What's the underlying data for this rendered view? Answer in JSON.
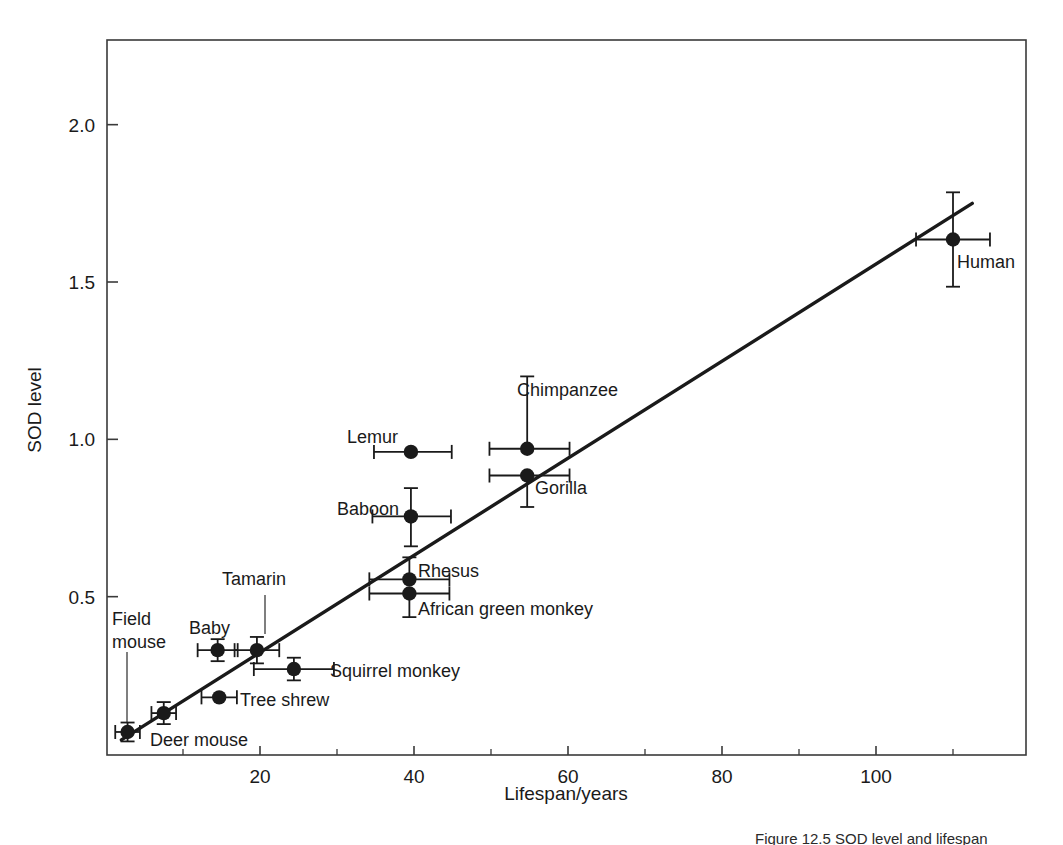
{
  "figure": {
    "caption": "Figure 12.5 SOD level and lifespan",
    "background": "#ffffff",
    "ink_color": "#1a1a1a"
  },
  "chart_data": {
    "type": "scatter",
    "title": "",
    "xlabel": "Lifespan/years",
    "ylabel": "SOD level",
    "xlim": [
      0,
      119.7
    ],
    "ylim": [
      0,
      2.27
    ],
    "xticks": [
      20,
      40,
      60,
      80,
      100
    ],
    "xtick_labels": [
      "20",
      "40",
      "60",
      "80",
      "100"
    ],
    "xminor_ticks": [
      10,
      30,
      50,
      70,
      90,
      110
    ],
    "yticks": [
      0.5,
      1.0,
      1.5,
      2.0
    ],
    "ytick_labels": [
      "0.5",
      "1.0",
      "1.5",
      "2.0"
    ],
    "grid": false,
    "legend": "none",
    "points": [
      {
        "name": "Deer mouse",
        "x": 2.8,
        "y": 0.07,
        "xerr_low": 1.6,
        "xerr_high": 1.6,
        "yerr_low": 0.03,
        "yerr_high": 0.03,
        "label": "Deer mouse",
        "label_x": 150,
        "label_y": 746,
        "anchor": "start",
        "leader": null
      },
      {
        "name": "Field mouse",
        "x": 7.5,
        "y": 0.13,
        "xerr_low": 1.6,
        "xerr_high": 1.6,
        "yerr_low": 0.035,
        "yerr_high": 0.035,
        "label": "Field\nmouse",
        "label_x": 112,
        "label_y": 625,
        "anchor": "start",
        "leader": {
          "x1": 127,
          "y1": 652,
          "x2": 127,
          "y2": 722
        }
      },
      {
        "name": "Tree shrew",
        "x": 14.7,
        "y": 0.18,
        "xerr_low": 2.3,
        "xerr_high": 2.3,
        "yerr_low": 0.0,
        "yerr_high": 0.0,
        "label": "Tree shrew",
        "label_x": 240,
        "label_y": 706,
        "anchor": "start",
        "leader": null
      },
      {
        "name": "Baby",
        "x": 14.5,
        "y": 0.33,
        "xerr_low": 2.6,
        "xerr_high": 2.6,
        "yerr_low": 0.035,
        "yerr_high": 0.035,
        "label": "Baby",
        "label_x": 189,
        "label_y": 634,
        "anchor": "start",
        "leader": null
      },
      {
        "name": "Tamarin",
        "x": 19.6,
        "y": 0.33,
        "xerr_low": 2.9,
        "xerr_high": 2.9,
        "yerr_low": 0.042,
        "yerr_high": 0.042,
        "label": "Tamarin",
        "label_x": 222,
        "label_y": 585,
        "anchor": "start",
        "leader": {
          "x1": 265,
          "y1": 595,
          "x2": 265,
          "y2": 634
        }
      },
      {
        "name": "Squirrel monkey",
        "x": 24.4,
        "y": 0.27,
        "xerr_low": 5.2,
        "xerr_high": 5.2,
        "yerr_low": 0.036,
        "yerr_high": 0.036,
        "label": "Squirrel monkey",
        "label_x": 330,
        "label_y": 677,
        "anchor": "start",
        "leader": null
      },
      {
        "name": "African green monkey",
        "x": 39.4,
        "y": 0.51,
        "xerr_low": 5.2,
        "xerr_high": 5.2,
        "yerr_low": 0.075,
        "yerr_high": 0.0,
        "label": "African green monkey",
        "label_x": 418,
        "label_y": 615,
        "anchor": "start",
        "leader": null
      },
      {
        "name": "Rhesus",
        "x": 39.4,
        "y": 0.555,
        "xerr_low": 5.2,
        "xerr_high": 5.2,
        "yerr_low": 0.0,
        "yerr_high": 0.07,
        "label": "Rhesus",
        "label_x": 418,
        "label_y": 577,
        "anchor": "start",
        "leader": null
      },
      {
        "name": "Baboon",
        "x": 39.6,
        "y": 0.755,
        "xerr_low": 5.0,
        "xerr_high": 5.2,
        "yerr_low": 0.095,
        "yerr_high": 0.09,
        "label": "Baboon",
        "label_x": 337,
        "label_y": 515,
        "anchor": "start",
        "leader": null
      },
      {
        "name": "Lemur",
        "x": 39.6,
        "y": 0.96,
        "xerr_low": 4.8,
        "xerr_high": 5.3,
        "yerr_low": 0.0,
        "yerr_high": 0.0,
        "label": "Lemur",
        "label_x": 347,
        "label_y": 443,
        "anchor": "start",
        "leader": null
      },
      {
        "name": "Gorilla",
        "x": 54.7,
        "y": 0.885,
        "xerr_low": 4.9,
        "xerr_high": 5.5,
        "yerr_low": 0.1,
        "yerr_high": 0.0,
        "label": "Gorilla",
        "label_x": 535,
        "label_y": 494,
        "anchor": "start",
        "leader": null
      },
      {
        "name": "Chimpanzee",
        "x": 54.7,
        "y": 0.97,
        "xerr_low": 4.9,
        "xerr_high": 5.5,
        "yerr_low": 0.0,
        "yerr_high": 0.23,
        "label": "Chimpanzee",
        "label_x": 517,
        "label_y": 396,
        "anchor": "start",
        "leader": null
      },
      {
        "name": "Human",
        "x": 110.0,
        "y": 1.635,
        "xerr_low": 4.8,
        "xerr_high": 4.8,
        "yerr_low": 0.15,
        "yerr_high": 0.15,
        "label": "Human",
        "label_x": 957,
        "label_y": 268,
        "anchor": "start",
        "leader": null
      }
    ],
    "fit_line": {
      "type": "linear-regression",
      "x_start": 2.0,
      "y_start": 0.045,
      "x_end": 112.5,
      "y_end": 1.75
    }
  }
}
